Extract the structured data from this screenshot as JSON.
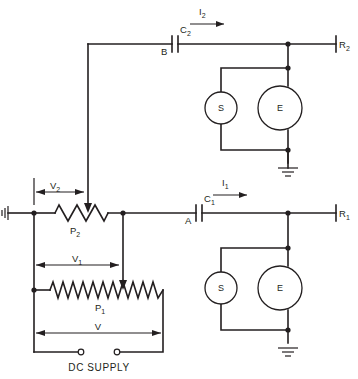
{
  "diagram": {
    "background_color": "#ffffff",
    "line_color": "#231f20"
  },
  "labels": {
    "current_top": "I",
    "current_top_sub": "2",
    "current_bottom": "I",
    "current_bottom_sub": "1",
    "cap_top": "C",
    "cap_top_sub": "2",
    "cap_bottom": "C",
    "cap_bottom_sub": "1",
    "node_b": "B",
    "node_a": "A",
    "res_top_right": "R",
    "res_top_right_sub": "2",
    "res_bottom_right": "R",
    "res_bottom_right_sub": "1",
    "pot_top": "P",
    "pot_top_sub": "2",
    "pot_bottom": "P",
    "pot_bottom_sub": "1",
    "volt_2": "V",
    "volt_2_sub": "2",
    "volt_1": "V",
    "volt_1_sub": "1",
    "volt_total": "V",
    "supply": "DC SUPPLY",
    "meter_s_top": "S",
    "meter_e_top": "E",
    "meter_s_bottom": "S",
    "meter_e_bottom": "E"
  },
  "components": {
    "meters": [
      {
        "id": "s-top",
        "label": "S",
        "cx": 221,
        "cy": 108,
        "r": 16
      },
      {
        "id": "e-top",
        "label": "E",
        "cx": 280,
        "cy": 108,
        "r": 22
      },
      {
        "id": "s-bottom",
        "label": "S",
        "cx": 221,
        "cy": 288,
        "r": 16
      },
      {
        "id": "e-bottom",
        "label": "E",
        "cx": 280,
        "cy": 288,
        "r": 22
      }
    ],
    "capacitors": [
      {
        "id": "c2",
        "label": "C2",
        "terminal": "B",
        "x": 172,
        "y": 44
      },
      {
        "id": "c1",
        "label": "C1",
        "terminal": "A",
        "x": 196,
        "y": 213
      }
    ],
    "resistors": [
      {
        "id": "p2",
        "label": "P2",
        "x1": 55,
        "x2": 110,
        "y": 213,
        "peaks": 6
      },
      {
        "id": "p1",
        "label": "P1",
        "x1": 50,
        "x2": 163,
        "y": 290,
        "peaks": 13
      }
    ],
    "terminals": [
      {
        "id": "r2",
        "label": "R2",
        "x": 336,
        "y": 44
      },
      {
        "id": "r1",
        "label": "R1",
        "x": 336,
        "y": 213
      }
    ],
    "grounds": [
      {
        "id": "gnd-top",
        "x": 280,
        "y": 163
      },
      {
        "id": "gnd-bottom",
        "x": 280,
        "y": 343
      },
      {
        "id": "gnd-left",
        "x": 12,
        "y": 213
      }
    ],
    "supply_terminals": [
      {
        "id": "supply-neg",
        "cx": 78,
        "cy": 352
      },
      {
        "id": "supply-pos",
        "cx": 120,
        "cy": 352
      }
    ],
    "nodes": [
      {
        "x": 288,
        "y": 44
      },
      {
        "x": 288,
        "y": 68
      },
      {
        "x": 288,
        "y": 150
      },
      {
        "x": 288,
        "y": 213
      },
      {
        "x": 288,
        "y": 248
      },
      {
        "x": 288,
        "y": 330
      },
      {
        "x": 34,
        "y": 213
      },
      {
        "x": 34,
        "y": 290
      },
      {
        "x": 123,
        "y": 213
      }
    ]
  }
}
